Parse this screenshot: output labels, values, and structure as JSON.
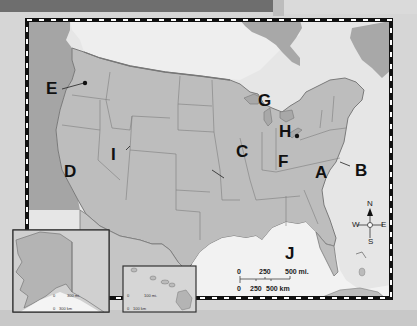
{
  "map": {
    "title": "United States",
    "labels": [
      {
        "id": "A",
        "text": "A"
      },
      {
        "id": "B",
        "text": "B"
      },
      {
        "id": "C",
        "text": "C"
      },
      {
        "id": "D",
        "text": "D"
      },
      {
        "id": "E",
        "text": "E"
      },
      {
        "id": "F",
        "text": "F"
      },
      {
        "id": "G",
        "text": "G"
      },
      {
        "id": "H",
        "text": "H"
      },
      {
        "id": "I",
        "text": "I"
      },
      {
        "id": "J",
        "text": "J"
      }
    ],
    "compass": {
      "n": "N",
      "s": "S",
      "e": "E",
      "w": "W"
    },
    "scale": {
      "miles": [
        "0",
        "250",
        "500 mi."
      ],
      "km": [
        "0",
        "250",
        "500 km"
      ]
    },
    "alaska_inset": {
      "scale_mi": [
        "0",
        "300 mi."
      ],
      "scale_km": [
        "0",
        "300 km"
      ]
    },
    "hawaii_inset": {
      "scale_mi": [
        "0",
        "100 mi."
      ],
      "scale_km": [
        "0",
        "100 km"
      ]
    },
    "colors": {
      "land": "#b9b9b9",
      "water": "#e8e8e8",
      "ocean_dark": "#9c9c9c",
      "border": "#111111"
    }
  }
}
